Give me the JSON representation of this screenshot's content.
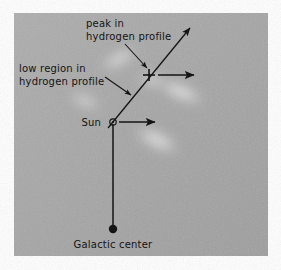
{
  "figure": {
    "panel": {
      "background_color": "#a8a8a8",
      "x": 14,
      "y": 13,
      "width": 254,
      "height": 243
    },
    "page_background_color": "#ffffff",
    "ink_color": "#141414"
  },
  "labels": [
    {
      "id": "peak-in-hydrogen-profile",
      "line1": "peak in",
      "line2": "hydrogen profile",
      "x": 86,
      "y": 27,
      "line_height": 13,
      "anchor": "start"
    },
    {
      "id": "low-region-in-hydrogen-profile",
      "line1": "low region in",
      "line2": "hydrogen profile",
      "x": 19,
      "y": 72,
      "line_height": 13,
      "anchor": "start"
    },
    {
      "id": "sun",
      "line1": "Sun",
      "x": 101,
      "y": 126,
      "anchor": "end"
    },
    {
      "id": "galactic-center",
      "line1": "Galactic center",
      "x": 113,
      "y": 248,
      "anchor": "middle"
    }
  ],
  "markers": {
    "sun": {
      "name": "Sun",
      "symbol": "sun-circle-dot",
      "x": 113,
      "y": 122,
      "outer_radius": 3.2,
      "inner_radius": 1.1
    },
    "galactic_center": {
      "name": "Galactic center",
      "symbol": "filled-dot",
      "x": 113,
      "y": 229,
      "radius": 4.2
    },
    "peak": {
      "name": "peak in hydrogen profile",
      "symbol": "plus-crosshair",
      "x": 149,
      "y": 75,
      "arm": 6
    }
  },
  "lines": {
    "sight_line": {
      "name": "line-of-sight",
      "x1": 108,
      "y1": 128,
      "x2": 190,
      "y2": 28,
      "arrowhead": "end"
    },
    "galactic_radius_line": {
      "name": "sun-to-galactic-center",
      "x1": 113,
      "y1": 124,
      "x2": 113,
      "y2": 227,
      "arrowhead": "none"
    }
  },
  "arrows": [
    {
      "id": "peak-velocity-arrow",
      "x1": 158,
      "y1": 75,
      "x2": 194,
      "y2": 75
    },
    {
      "id": "sun-velocity-arrow",
      "x1": 119,
      "y1": 122,
      "x2": 155,
      "y2": 122
    },
    {
      "id": "peak-callout-arrow",
      "x1": 125,
      "y1": 44,
      "x2": 147,
      "y2": 68
    },
    {
      "id": "low-region-callout-arrow",
      "x1": 105,
      "y1": 77,
      "x2": 131,
      "y2": 95
    }
  ],
  "clouds": [
    {
      "id": "cloud-upper-center",
      "cx": 119,
      "cy": 59,
      "rx": 24,
      "ry": 9,
      "rotate": -28,
      "opacity": 0.62
    },
    {
      "id": "cloud-right-upper",
      "cx": 181,
      "cy": 92,
      "rx": 29,
      "ry": 10,
      "rotate": 24,
      "opacity": 0.72
    },
    {
      "id": "cloud-left-mid",
      "cx": 85,
      "cy": 101,
      "rx": 20,
      "ry": 8,
      "rotate": 22,
      "opacity": 0.55
    },
    {
      "id": "cloud-center-lower",
      "cx": 157,
      "cy": 140,
      "rx": 28,
      "ry": 11,
      "rotate": 26,
      "opacity": 0.7
    },
    {
      "id": "cloud-peak-glow",
      "cx": 152,
      "cy": 80,
      "rx": 15,
      "ry": 9,
      "rotate": 18,
      "opacity": 0.55
    }
  ],
  "icons": {
    "sun_symbol_name": "sun-symbol-icon",
    "galactic_center_dot_name": "filled-dot-icon",
    "crosshair_name": "plus-crosshair-icon",
    "arrowhead_name": "arrowhead-icon"
  }
}
